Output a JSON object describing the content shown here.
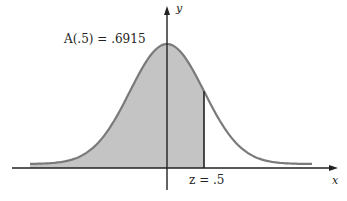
{
  "chart_data": {
    "type": "area",
    "title": "",
    "xlabel": "x",
    "ylabel": "y",
    "annotation": "A(.5) = .6915",
    "z_label": "z = .5",
    "z_value": 0.5,
    "shaded_area": 0.6915,
    "shaded_region": "left of z",
    "colors": {
      "curve": "#7a7a7a",
      "fill": "#c4c4c4",
      "axis": "#222222"
    }
  },
  "labels": {
    "annotation": "A(.5) = .6915",
    "y_axis": "y",
    "x_axis": "x",
    "z_mark": "z = .5"
  }
}
